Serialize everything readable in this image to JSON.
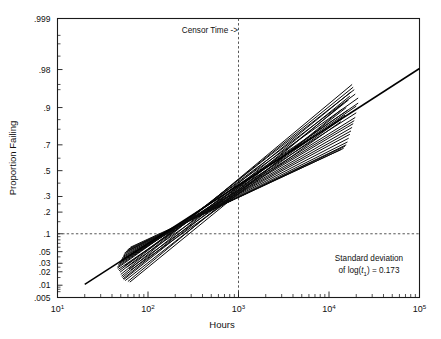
{
  "chart_data": {
    "type": "line",
    "title": "",
    "xlabel": "Hours",
    "ylabel": "Proportion Failing",
    "x_scale": "log10",
    "y_scale": "lognormal-probability",
    "xlim": [
      10,
      100000
    ],
    "ylim": [
      0.005,
      0.999
    ],
    "grid": false,
    "legend": null,
    "x_tick_labels": [
      "10 1",
      "10 2",
      "10 3",
      "10 4",
      "10 5"
    ],
    "x_tick_bases": [
      "10",
      "10",
      "10",
      "10",
      "10"
    ],
    "x_tick_exponents": [
      "1",
      "2",
      "3",
      "4",
      "5"
    ],
    "x_tick_values": [
      10,
      100,
      1000,
      10000,
      100000
    ],
    "y_tick_labels": [
      ".999",
      ".98",
      ".9",
      ".7",
      ".5",
      ".3",
      ".2",
      ".1",
      ".05",
      ".03",
      ".02",
      ".01",
      ".005"
    ],
    "y_tick_values": [
      0.999,
      0.98,
      0.9,
      0.7,
      0.5,
      0.3,
      0.2,
      0.1,
      0.05,
      0.03,
      0.02,
      0.01,
      0.005
    ],
    "annotations": [
      {
        "name": "censor-time-label",
        "text": "Censor Time ->",
        "x_value": 1000,
        "y_value": 0.985
      },
      {
        "name": "sd-note-line1",
        "text": "Standard deviation",
        "x_value": 18000,
        "y_value": 0.019
      },
      {
        "name": "sd-note-line2-prefix",
        "text": "of log(",
        "text_var": "t",
        "text_sub": "1",
        "text_suffix": ") = 0.173",
        "value": 0.173,
        "x_value": 18000,
        "y_value": 0.013
      }
    ],
    "reference_lines": [
      {
        "name": "censor-time-vline",
        "orientation": "vertical",
        "x_value": 1000,
        "style": "dashed"
      },
      {
        "name": "proportion-hline",
        "orientation": "horizontal",
        "y_value": 0.1,
        "style": "dashed"
      }
    ],
    "population_line": {
      "name": "true-lognormal-line",
      "comment": "Long reference/true distribution line spanning the plot",
      "points": [
        [
          20,
          0.0105
        ],
        [
          100000,
          0.981
        ]
      ]
    },
    "series": [
      {
        "name": "ml-fit-01",
        "points": [
          [
            46,
            0.0255
          ],
          [
            21000,
            0.915
          ]
        ]
      },
      {
        "name": "ml-fit-02",
        "points": [
          [
            46,
            0.024
          ],
          [
            21000,
            0.93
          ]
        ]
      },
      {
        "name": "ml-fit-03",
        "points": [
          [
            47,
            0.0225
          ],
          [
            20000,
            0.905
          ]
        ]
      },
      {
        "name": "ml-fit-04",
        "points": [
          [
            47,
            0.028
          ],
          [
            20000,
            0.88
          ]
        ]
      },
      {
        "name": "ml-fit-05",
        "points": [
          [
            48,
            0.03
          ],
          [
            19500,
            0.86
          ]
        ]
      },
      {
        "name": "ml-fit-06",
        "points": [
          [
            48,
            0.021
          ],
          [
            19500,
            0.94
          ]
        ]
      },
      {
        "name": "ml-fit-07",
        "points": [
          [
            49,
            0.0195
          ],
          [
            19000,
            0.95
          ]
        ]
      },
      {
        "name": "ml-fit-08",
        "points": [
          [
            49,
            0.032
          ],
          [
            19000,
            0.845
          ]
        ]
      },
      {
        "name": "ml-fit-09",
        "points": [
          [
            50,
            0.0175
          ],
          [
            18500,
            0.955
          ]
        ]
      },
      {
        "name": "ml-fit-10",
        "points": [
          [
            50,
            0.034
          ],
          [
            18500,
            0.83
          ]
        ]
      },
      {
        "name": "ml-fit-11",
        "points": [
          [
            51,
            0.016
          ],
          [
            18000,
            0.96
          ]
        ]
      },
      {
        "name": "ml-fit-12",
        "points": [
          [
            51,
            0.036
          ],
          [
            18000,
            0.81
          ]
        ]
      },
      {
        "name": "ml-fit-13",
        "points": [
          [
            52,
            0.015
          ],
          [
            17500,
            0.945
          ]
        ]
      },
      {
        "name": "ml-fit-14",
        "points": [
          [
            52,
            0.0385
          ],
          [
            17500,
            0.79
          ]
        ]
      },
      {
        "name": "ml-fit-15",
        "points": [
          [
            53,
            0.014
          ],
          [
            17000,
            0.935
          ]
        ]
      },
      {
        "name": "ml-fit-16",
        "points": [
          [
            53,
            0.041
          ],
          [
            17000,
            0.77
          ]
        ]
      },
      {
        "name": "ml-fit-17",
        "points": [
          [
            54,
            0.0135
          ],
          [
            16500,
            0.925
          ]
        ]
      },
      {
        "name": "ml-fit-18",
        "points": [
          [
            54,
            0.044
          ],
          [
            16500,
            0.745
          ]
        ]
      },
      {
        "name": "ml-fit-19",
        "points": [
          [
            55,
            0.0265
          ],
          [
            16000,
            0.89
          ]
        ]
      },
      {
        "name": "ml-fit-20",
        "points": [
          [
            55,
            0.047
          ],
          [
            16000,
            0.72
          ]
        ]
      },
      {
        "name": "ml-fit-21",
        "points": [
          [
            56,
            0.0128
          ],
          [
            15500,
            0.9
          ]
        ]
      },
      {
        "name": "ml-fit-22",
        "points": [
          [
            57,
            0.05
          ],
          [
            15500,
            0.7
          ]
        ]
      },
      {
        "name": "ml-fit-23",
        "points": [
          [
            58,
            0.0248
          ],
          [
            15000,
            0.87
          ]
        ]
      },
      {
        "name": "ml-fit-24",
        "points": [
          [
            59,
            0.053
          ],
          [
            15000,
            0.69
          ]
        ]
      },
      {
        "name": "ml-fit-25",
        "points": [
          [
            60,
            0.0122
          ],
          [
            14500,
            0.915
          ]
        ]
      },
      {
        "name": "ml-fit-26",
        "points": [
          [
            61,
            0.056
          ],
          [
            14500,
            0.675
          ]
        ]
      },
      {
        "name": "ml-fit-27",
        "points": [
          [
            62,
            0.0232
          ],
          [
            14000,
            0.855
          ]
        ]
      },
      {
        "name": "ml-fit-28",
        "points": [
          [
            63,
            0.0118
          ],
          [
            14000,
            0.895
          ]
        ]
      },
      {
        "name": "ml-fit-29",
        "points": [
          [
            64,
            0.06
          ],
          [
            13500,
            0.665
          ]
        ]
      },
      {
        "name": "ml-fit-30",
        "points": [
          [
            65,
            0.022
          ],
          [
            13500,
            0.84
          ]
        ]
      }
    ],
    "convergence_point": {
      "x_value": 1000,
      "y_value": 0.2
    }
  }
}
